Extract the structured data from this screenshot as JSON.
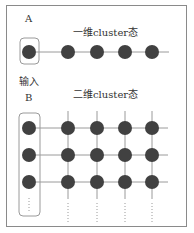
{
  "diagram": {
    "label_a": "A",
    "title_1d": "一维cluster态",
    "input_label": "输入",
    "label_b": "B",
    "title_2d": "二维cluster态",
    "colors": {
      "node": "#414141",
      "edge": "#9a9a9a",
      "frame": "#8a8a8a",
      "input_box": "#9a9a9a"
    },
    "one_d": {
      "input_node": {
        "x": 29,
        "y": 52
      },
      "nodes_x": [
        68,
        97,
        125,
        152
      ],
      "y": 52
    },
    "two_d": {
      "input_nodes_y": [
        128,
        155,
        182
      ],
      "columns_x": [
        68,
        97,
        125,
        152
      ],
      "rows_y": [
        128,
        155,
        182
      ],
      "continuation": "......"
    }
  }
}
